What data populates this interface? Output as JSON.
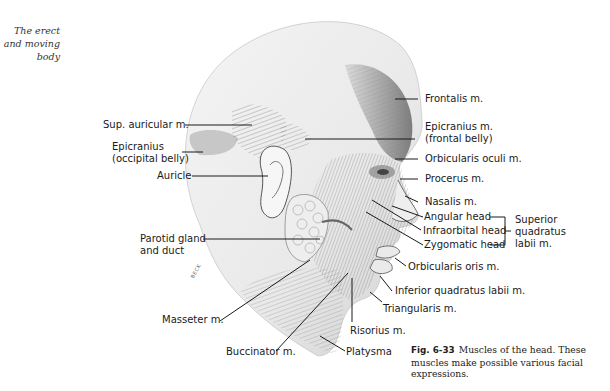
{
  "margin_note": {
    "line1": "The erect",
    "line2": "and moving",
    "line3": "body"
  },
  "figure": {
    "artist_signature": "BECK",
    "labels_left": {
      "sup_auricular": "Sup. auricular m.",
      "epicranius_occ_1": "Epicranius",
      "epicranius_occ_2": "(occipital belly)",
      "auricle": "Auricle",
      "parotid_1": "Parotid gland",
      "parotid_2": "and duct",
      "masseter": "Masseter m.",
      "buccinator": "Buccinator m."
    },
    "labels_right": {
      "frontalis": "Frontalis m.",
      "epicranius_front_1": "Epicranius m.",
      "epicranius_front_2": "(frontal belly)",
      "orbicularis_oculi": "Orbicularis oculi m.",
      "procerus": "Procerus m.",
      "nasalis": "Nasalis m.",
      "angular_head": "Angular head",
      "infraorbital_head": "Infraorbital head",
      "zygomatic_head": "Zygomatic head",
      "bracket_group_1": "Superior",
      "bracket_group_2": "quadratus",
      "bracket_group_3": "labii m.",
      "orbicularis_oris": "Orbicularis oris m.",
      "inferior_quadratus": "Inferior quadratus labii m.",
      "triangularis": "Triangularis m.",
      "risorius": "Risorius m.",
      "platysma": "Platysma"
    }
  },
  "caption": {
    "fig_number": "Fig. 6-33",
    "text": "Muscles of the head. These muscles make possible various facial expressions."
  }
}
